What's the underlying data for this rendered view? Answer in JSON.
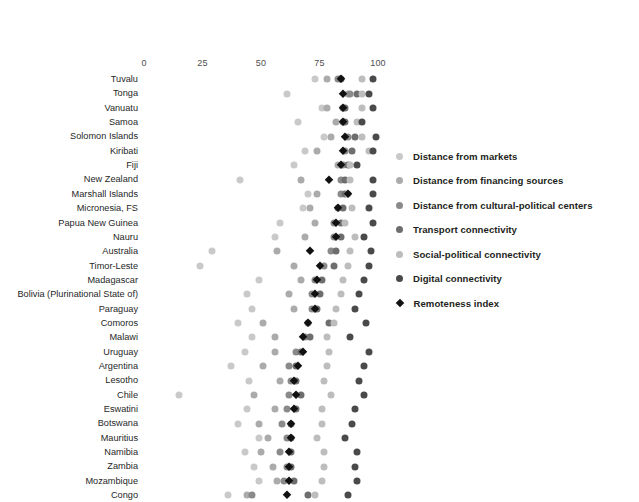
{
  "chart_data": {
    "type": "scatter",
    "title": "",
    "subtitle": "",
    "xlabel": "",
    "ylabel": "",
    "xlim": [
      0,
      100
    ],
    "ticks": [
      0,
      25,
      50,
      75,
      100
    ],
    "tick_labels": [
      "0",
      "25",
      "50",
      "75",
      "100"
    ],
    "grid": false,
    "legend_position": "right",
    "series": [
      {
        "name": "Distance from markets",
        "color": "#c9c9c9",
        "marker": "circle"
      },
      {
        "name": "Distance from financing sources",
        "color": "#ababab",
        "marker": "circle"
      },
      {
        "name": "Distance from cultural-political centers",
        "color": "#8a8a8a",
        "marker": "circle"
      },
      {
        "name": "Transport connectivity",
        "color": "#6e6e6e",
        "marker": "circle"
      },
      {
        "name": "Social-political connectivity",
        "color": "#bdbdbd",
        "marker": "circle"
      },
      {
        "name": "Digital connectivity",
        "color": "#4a4a4a",
        "marker": "circle"
      },
      {
        "name": "Remoteness index",
        "color": "#111111",
        "marker": "diamond"
      }
    ],
    "categories": [
      "Tuvalu",
      "Tonga",
      "Vanuatu",
      "Samoa",
      "Solomon Islands",
      "Kiribati",
      "Fiji",
      "New Zealand",
      "Marshall Islands",
      "Micronesia, FS",
      "Papua New Guinea",
      "Nauru",
      "Australia",
      "Timor-Leste",
      "Madagascar",
      "Bolivia (Plurinational State of)",
      "Paraguay",
      "Comoros",
      "Malawi",
      "Uruguay",
      "Argentina",
      "Lesotho",
      "Chile",
      "Eswatini",
      "Botswana",
      "Mauritius",
      "Namibia",
      "Zambia",
      "Mozambique",
      "Congo"
    ],
    "rows": [
      {
        "category": "Tuvalu",
        "values": {
          "Distance from markets": 73,
          "Distance from financing sources": 78,
          "Distance from cultural-political centers": 83,
          "Transport connectivity": 84,
          "Social-political connectivity": 93,
          "Digital connectivity": 98,
          "Remoteness index": 84
        }
      },
      {
        "category": "Tonga",
        "values": {
          "Distance from markets": 61,
          "Distance from financing sources": 87,
          "Distance from cultural-political centers": 88,
          "Transport connectivity": 91,
          "Social-political connectivity": 93,
          "Digital connectivity": 96,
          "Remoteness index": 85
        }
      },
      {
        "category": "Vanuatu",
        "values": {
          "Distance from markets": 76,
          "Distance from financing sources": 78,
          "Distance from cultural-political centers": 85,
          "Transport connectivity": 86,
          "Social-political connectivity": 93,
          "Digital connectivity": 98,
          "Remoteness index": 85
        }
      },
      {
        "category": "Samoa",
        "values": {
          "Distance from markets": 66,
          "Distance from financing sources": 82,
          "Distance from cultural-political centers": 85,
          "Transport connectivity": 86,
          "Social-political connectivity": 91,
          "Digital connectivity": 93,
          "Remoteness index": 85
        }
      },
      {
        "category": "Solomon Islands",
        "values": {
          "Distance from markets": 77,
          "Distance from financing sources": 80,
          "Distance from cultural-political centers": 87,
          "Transport connectivity": 90,
          "Social-political connectivity": 93,
          "Digital connectivity": 99,
          "Remoteness index": 86
        }
      },
      {
        "category": "Kiribati",
        "values": {
          "Distance from markets": 69,
          "Distance from financing sources": 74,
          "Distance from cultural-political centers": 86,
          "Transport connectivity": 89,
          "Social-political connectivity": 96,
          "Digital connectivity": 98,
          "Remoteness index": 85
        }
      },
      {
        "category": "Fiji",
        "values": {
          "Distance from markets": 64,
          "Distance from financing sources": 83,
          "Distance from cultural-political centers": 85,
          "Transport connectivity": 87,
          "Social-political connectivity": 88,
          "Digital connectivity": 91,
          "Remoteness index": 84
        }
      },
      {
        "category": "New Zealand",
        "values": {
          "Distance from markets": 41,
          "Distance from financing sources": 67,
          "Distance from cultural-political centers": 84,
          "Transport connectivity": 86,
          "Social-political connectivity": 88,
          "Digital connectivity": 98,
          "Remoteness index": 79
        }
      },
      {
        "category": "Marshall Islands",
        "values": {
          "Distance from markets": 70,
          "Distance from financing sources": 74,
          "Distance from cultural-political centers": 84,
          "Transport connectivity": 86,
          "Social-political connectivity": 87,
          "Digital connectivity": 98,
          "Remoteness index": 87
        }
      },
      {
        "category": "Micronesia, FS",
        "values": {
          "Distance from markets": 68,
          "Distance from financing sources": 71,
          "Distance from cultural-political centers": 83,
          "Transport connectivity": 85,
          "Social-political connectivity": 89,
          "Digital connectivity": 96,
          "Remoteness index": 83
        }
      },
      {
        "category": "Papua New Guinea",
        "values": {
          "Distance from markets": 58,
          "Distance from financing sources": 73,
          "Distance from cultural-political centers": 81,
          "Transport connectivity": 84,
          "Social-political connectivity": 86,
          "Digital connectivity": 98,
          "Remoteness index": 82
        }
      },
      {
        "category": "Nauru",
        "values": {
          "Distance from markets": 56,
          "Distance from financing sources": 69,
          "Distance from cultural-political centers": 81,
          "Transport connectivity": 84,
          "Social-political connectivity": 90,
          "Digital connectivity": 94,
          "Remoteness index": 82
        }
      },
      {
        "category": "Australia",
        "values": {
          "Distance from markets": 29,
          "Distance from financing sources": 57,
          "Distance from cultural-political centers": 80,
          "Transport connectivity": 82,
          "Social-political connectivity": 88,
          "Digital connectivity": 97,
          "Remoteness index": 71
        }
      },
      {
        "category": "Timor-Leste",
        "values": {
          "Distance from markets": 24,
          "Distance from financing sources": 64,
          "Distance from cultural-political centers": 77,
          "Transport connectivity": 81,
          "Social-political connectivity": 87,
          "Digital connectivity": 96,
          "Remoteness index": 75
        }
      },
      {
        "category": "Madagascar",
        "values": {
          "Distance from markets": 49,
          "Distance from financing sources": 67,
          "Distance from cultural-political centers": 73,
          "Transport connectivity": 76,
          "Social-political connectivity": 85,
          "Digital connectivity": 94,
          "Remoteness index": 74
        }
      },
      {
        "category": "Bolivia (Plurinational State of)",
        "values": {
          "Distance from markets": 44,
          "Distance from financing sources": 62,
          "Distance from cultural-political centers": 72,
          "Transport connectivity": 75,
          "Social-political connectivity": 84,
          "Digital connectivity": 92,
          "Remoteness index": 73
        }
      },
      {
        "category": "Paraguay",
        "values": {
          "Distance from markets": 46,
          "Distance from financing sources": 64,
          "Distance from cultural-political centers": 72,
          "Transport connectivity": 74,
          "Social-political connectivity": 82,
          "Digital connectivity": 90,
          "Remoteness index": 73
        }
      },
      {
        "category": "Comoros",
        "values": {
          "Distance from markets": 40,
          "Distance from financing sources": 51,
          "Distance from cultural-political centers": 70,
          "Transport connectivity": 79,
          "Social-political connectivity": 81,
          "Digital connectivity": 95,
          "Remoteness index": 70
        }
      },
      {
        "category": "Malawi",
        "values": {
          "Distance from markets": 46,
          "Distance from financing sources": 56,
          "Distance from cultural-political centers": 69,
          "Transport connectivity": 71,
          "Social-political connectivity": 78,
          "Digital connectivity": 88,
          "Remoteness index": 68
        }
      },
      {
        "category": "Uruguay",
        "values": {
          "Distance from markets": 43,
          "Distance from financing sources": 56,
          "Distance from cultural-political centers": 65,
          "Transport connectivity": 67,
          "Social-political connectivity": 79,
          "Digital connectivity": 96,
          "Remoteness index": 68
        }
      },
      {
        "category": "Argentina",
        "values": {
          "Distance from markets": 37,
          "Distance from financing sources": 51,
          "Distance from cultural-political centers": 62,
          "Transport connectivity": 65,
          "Social-political connectivity": 78,
          "Digital connectivity": 94,
          "Remoteness index": 66
        }
      },
      {
        "category": "Lesotho",
        "values": {
          "Distance from markets": 45,
          "Distance from financing sources": 58,
          "Distance from cultural-political centers": 63,
          "Transport connectivity": 65,
          "Social-political connectivity": 77,
          "Digital connectivity": 92,
          "Remoteness index": 64
        }
      },
      {
        "category": "Chile",
        "values": {
          "Distance from markets": 15,
          "Distance from financing sources": 47,
          "Distance from cultural-political centers": 62,
          "Transport connectivity": 67,
          "Social-political connectivity": 80,
          "Digital connectivity": 94,
          "Remoteness index": 65
        }
      },
      {
        "category": "Eswatini",
        "values": {
          "Distance from markets": 44,
          "Distance from financing sources": 56,
          "Distance from cultural-political centers": 61,
          "Transport connectivity": 65,
          "Social-political connectivity": 76,
          "Digital connectivity": 90,
          "Remoteness index": 64
        }
      },
      {
        "category": "Botswana",
        "values": {
          "Distance from markets": 40,
          "Distance from financing sources": 49,
          "Distance from cultural-political centers": 59,
          "Transport connectivity": 63,
          "Social-political connectivity": 76,
          "Digital connectivity": 89,
          "Remoteness index": 63
        }
      },
      {
        "category": "Mauritius",
        "values": {
          "Distance from markets": 49,
          "Distance from financing sources": 53,
          "Distance from cultural-political centers": 61,
          "Transport connectivity": 63,
          "Social-political connectivity": 74,
          "Digital connectivity": 86,
          "Remoteness index": 63
        }
      },
      {
        "category": "Namibia",
        "values": {
          "Distance from markets": 43,
          "Distance from financing sources": 50,
          "Distance from cultural-political centers": 58,
          "Transport connectivity": 63,
          "Social-political connectivity": 77,
          "Digital connectivity": 91,
          "Remoteness index": 62
        }
      },
      {
        "category": "Zambia",
        "values": {
          "Distance from markets": 47,
          "Distance from financing sources": 55,
          "Distance from cultural-political centers": 61,
          "Transport connectivity": 63,
          "Social-political connectivity": 77,
          "Digital connectivity": 90,
          "Remoteness index": 62
        }
      },
      {
        "category": "Mozambique",
        "values": {
          "Distance from markets": 49,
          "Distance from financing sources": 57,
          "Distance from cultural-political centers": 60,
          "Transport connectivity": 64,
          "Social-political connectivity": 76,
          "Digital connectivity": 91,
          "Remoteness index": 62
        }
      },
      {
        "category": "Congo",
        "values": {
          "Distance from markets": 36,
          "Distance from financing sources": 44,
          "Distance from cultural-political centers": 46,
          "Transport connectivity": 70,
          "Social-political connectivity": 73,
          "Digital connectivity": 87,
          "Remoteness index": 61
        }
      }
    ]
  }
}
